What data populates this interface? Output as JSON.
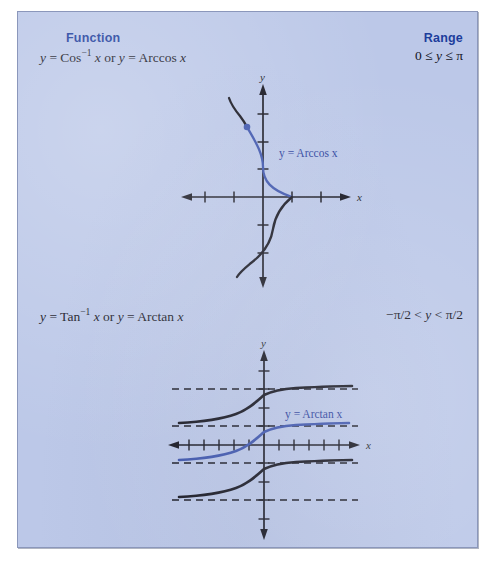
{
  "panel": {
    "background_color": "#bcc8e8",
    "border_color": "#8b97bb",
    "accent_color": "#1c3d9c",
    "curve_blue": "#3b53ac",
    "curve_black": "#14141e"
  },
  "headers": {
    "function": "Function",
    "range": "Range"
  },
  "rows": [
    {
      "formula_html": "<i>y</i> = Cos<span class=\"sup\">−1</span> <i>x</i> or <i>y</i> = Arccos <i>x</i>",
      "formula_text": "y = Cos⁻¹ x or y = Arccos x",
      "range_html": "0 ≤ <i>y</i> ≤ π",
      "range_text": "0 ≤ y ≤ π",
      "curve_label": "y = Arccos x",
      "x_axis_label": "x",
      "y_axis_label": "y"
    },
    {
      "formula_html": "<i>y</i> = Tan<span class=\"sup\">−1</span> <i>x</i> or <i>y</i> = Arctan <i>x</i>",
      "formula_text": "y = Tan⁻¹ x or y = Arctan x",
      "range_html": "−π/2 &lt; <i>y</i> &lt; π/2",
      "range_text": "−π/2 < y < π/2",
      "curve_label": "y = Arctan x",
      "x_axis_label": "x",
      "y_axis_label": "y"
    }
  ],
  "chart_data": [
    {
      "type": "line",
      "title": "y = Arccos x",
      "xlabel": "x",
      "ylabel": "y",
      "xlim": [
        -3.2,
        2.2
      ],
      "ylim": [
        -3.6,
        3.6
      ],
      "grid": false,
      "legend": "none",
      "annotations": [
        "y = Arccos x"
      ],
      "x_ticks": [
        -3,
        -2,
        -1,
        1
      ],
      "y_ticks": [
        -3,
        -2,
        -1,
        1,
        2,
        3
      ],
      "series": [
        {
          "name": "Arccos principal branch",
          "color": "#3b53ac",
          "style": "solid",
          "note": "blue portion, 0 <= y <= pi; x from -1 to 1 drawn as x = cos(y)",
          "points": [
            [
              -1.0,
              3.1416
            ],
            [
              -0.95,
              2.8198
            ],
            [
              -0.81,
              2.5133
            ],
            [
              -0.59,
              2.2
            ],
            [
              -0.31,
              1.885
            ],
            [
              0.0,
              1.5708
            ],
            [
              0.31,
              1.2566
            ],
            [
              0.59,
              0.9425
            ],
            [
              0.81,
              0.6283
            ],
            [
              0.95,
              0.3142
            ],
            [
              1.0,
              0.0
            ]
          ]
        },
        {
          "name": "Cosine inverse upper continuation",
          "color": "#14141e",
          "style": "solid",
          "note": "black arc above the blue dot, y from pi to about 3.6",
          "points": [
            [
              -1.0,
              3.1416
            ],
            [
              -0.95,
              3.45
            ],
            [
              -0.81,
              3.62
            ]
          ]
        },
        {
          "name": "Cosine inverse lower continuation",
          "color": "#14141e",
          "style": "solid",
          "note": "black arc below the x-axis, y from 0 down to about -3.5",
          "points": [
            [
              1.0,
              0.0
            ],
            [
              0.95,
              -0.31
            ],
            [
              0.81,
              -0.63
            ],
            [
              0.59,
              -0.94
            ],
            [
              0.31,
              -1.26
            ],
            [
              0.0,
              -1.57
            ],
            [
              -0.31,
              -1.89
            ],
            [
              -0.59,
              -2.2
            ],
            [
              -0.81,
              -2.51
            ],
            [
              -0.95,
              -2.82
            ],
            [
              -1.0,
              -3.14
            ],
            [
              -0.95,
              -3.45
            ]
          ]
        }
      ],
      "markers": [
        {
          "name": "branch-endpoint-dot",
          "x": -1.0,
          "y": 3.1416,
          "color": "#3b53ac"
        }
      ]
    },
    {
      "type": "line",
      "title": "y = Arctan x",
      "xlabel": "x",
      "ylabel": "y",
      "xlim": [
        -5.5,
        5.5
      ],
      "ylim": [
        -5.2,
        5.2
      ],
      "grid": false,
      "legend": "none",
      "annotations": [
        "y = Arctan x"
      ],
      "x_ticks": [
        -5,
        -4,
        -3,
        -2,
        -1,
        1,
        2,
        3,
        4,
        5
      ],
      "y_ticks": [
        -4,
        -3,
        -2,
        -1,
        1,
        2,
        3,
        4
      ],
      "asymptotes": [
        {
          "y": 4.712,
          "style": "dashed",
          "label": "3π/2"
        },
        {
          "y": 1.571,
          "style": "dashed",
          "label": "π/2"
        },
        {
          "y": -1.571,
          "style": "dashed",
          "label": "−π/2"
        },
        {
          "y": -4.712,
          "style": "dashed",
          "label": "−3π/2"
        }
      ],
      "series": [
        {
          "name": "Arctan upper branch",
          "color": "#14141e",
          "style": "solid",
          "note": "arctan(x) + pi, asymptotes at pi/2 and 3pi/2",
          "points": [
            [
              -5.0,
              1.768
            ],
            [
              -4.0,
              1.817
            ],
            [
              -3.0,
              1.893
            ],
            [
              -2.0,
              2.034
            ],
            [
              -1.0,
              2.356
            ],
            [
              -0.5,
              2.678
            ],
            [
              0.0,
              3.1416
            ],
            [
              0.5,
              3.605
            ],
            [
              1.0,
              3.927
            ],
            [
              2.0,
              4.249
            ],
            [
              3.0,
              4.391
            ],
            [
              4.0,
              4.466
            ],
            [
              5.0,
              4.515
            ]
          ]
        },
        {
          "name": "Arctan principal branch",
          "color": "#3b53ac",
          "style": "solid",
          "note": "arctan(x), asymptotes at -pi/2 and pi/2",
          "points": [
            [
              -5.0,
              -1.373
            ],
            [
              -4.0,
              -1.326
            ],
            [
              -3.0,
              -1.249
            ],
            [
              -2.0,
              -1.107
            ],
            [
              -1.0,
              -0.785
            ],
            [
              -0.5,
              -0.464
            ],
            [
              0.0,
              0.0
            ],
            [
              0.5,
              0.464
            ],
            [
              1.0,
              0.785
            ],
            [
              2.0,
              1.107
            ],
            [
              3.0,
              1.249
            ],
            [
              4.0,
              1.326
            ],
            [
              5.0,
              1.373
            ]
          ]
        },
        {
          "name": "Arctan lower branch",
          "color": "#14141e",
          "style": "solid",
          "note": "arctan(x) - pi, asymptotes at -3pi/2 and -pi/2",
          "points": [
            [
              -5.0,
              -4.515
            ],
            [
              -4.0,
              -4.466
            ],
            [
              -3.0,
              -4.391
            ],
            [
              -2.0,
              -4.249
            ],
            [
              -1.0,
              -3.927
            ],
            [
              -0.5,
              -3.605
            ],
            [
              0.0,
              -3.1416
            ],
            [
              0.5,
              -2.678
            ],
            [
              1.0,
              -2.356
            ],
            [
              2.0,
              -2.034
            ],
            [
              3.0,
              -1.893
            ],
            [
              4.0,
              -1.817
            ],
            [
              5.0,
              -1.768
            ]
          ]
        }
      ]
    }
  ]
}
